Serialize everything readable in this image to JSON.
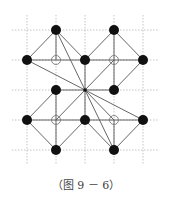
{
  "caption": "（图 9 － 6）",
  "grid": {
    "xs": [
      27,
      56,
      85,
      114,
      143
    ],
    "ys": [
      30,
      60,
      90,
      120,
      150
    ],
    "extent": {
      "x0": 12,
      "x1": 158,
      "y0": 15,
      "y1": 165
    },
    "color": "#b5b5b5"
  },
  "colors": {
    "line": "#555555",
    "dot": "#111111",
    "hollow_stroke": "#777777"
  },
  "filled_points": [
    [
      1,
      0
    ],
    [
      3,
      0
    ],
    [
      0,
      1
    ],
    [
      2,
      1
    ],
    [
      4,
      1
    ],
    [
      1,
      2
    ],
    [
      3,
      2
    ],
    [
      0,
      3
    ],
    [
      2,
      3
    ],
    [
      4,
      3
    ],
    [
      1,
      4
    ],
    [
      3,
      4
    ]
  ],
  "hollow_points": [
    [
      1,
      1
    ],
    [
      3,
      1
    ],
    [
      1,
      3
    ],
    [
      3,
      3
    ]
  ],
  "center_point": [
    2,
    2
  ],
  "segments": [
    [
      [
        1,
        0
      ],
      [
        0,
        1
      ]
    ],
    [
      [
        1,
        0
      ],
      [
        1,
        1
      ]
    ],
    [
      [
        1,
        0
      ],
      [
        2,
        1
      ]
    ],
    [
      [
        0,
        1
      ],
      [
        1,
        1
      ]
    ],
    [
      [
        1,
        1
      ],
      [
        2,
        1
      ]
    ],
    [
      [
        1,
        0
      ],
      [
        2,
        2
      ]
    ],
    [
      [
        0,
        1
      ],
      [
        2,
        2
      ]
    ],
    [
      [
        3,
        0
      ],
      [
        2,
        1
      ]
    ],
    [
      [
        3,
        0
      ],
      [
        3,
        1
      ]
    ],
    [
      [
        3,
        0
      ],
      [
        4,
        1
      ]
    ],
    [
      [
        2,
        1
      ],
      [
        3,
        1
      ]
    ],
    [
      [
        3,
        1
      ],
      [
        4,
        1
      ]
    ],
    [
      [
        2,
        1
      ],
      [
        2,
        2
      ]
    ],
    [
      [
        3,
        1
      ],
      [
        2,
        2
      ]
    ],
    [
      [
        4,
        1
      ],
      [
        3,
        2
      ]
    ],
    [
      [
        3,
        1
      ],
      [
        3,
        2
      ]
    ],
    [
      [
        0,
        3
      ],
      [
        1,
        2
      ]
    ],
    [
      [
        1,
        2
      ],
      [
        1,
        3
      ]
    ],
    [
      [
        1,
        2
      ],
      [
        2,
        2
      ]
    ],
    [
      [
        1,
        3
      ],
      [
        2,
        2
      ]
    ],
    [
      [
        0,
        3
      ],
      [
        1,
        3
      ]
    ],
    [
      [
        1,
        3
      ],
      [
        2,
        3
      ]
    ],
    [
      [
        0,
        3
      ],
      [
        1,
        4
      ]
    ],
    [
      [
        1,
        3
      ],
      [
        1,
        4
      ]
    ],
    [
      [
        2,
        3
      ],
      [
        1,
        4
      ]
    ],
    [
      [
        3,
        2
      ],
      [
        2,
        2
      ]
    ],
    [
      [
        2,
        2
      ],
      [
        2,
        3
      ]
    ],
    [
      [
        2,
        2
      ],
      [
        3,
        3
      ]
    ],
    [
      [
        2,
        2
      ],
      [
        4,
        3
      ]
    ],
    [
      [
        2,
        2
      ],
      [
        3,
        4
      ]
    ],
    [
      [
        2,
        3
      ],
      [
        3,
        3
      ]
    ],
    [
      [
        3,
        3
      ],
      [
        4,
        3
      ]
    ],
    [
      [
        3,
        3
      ],
      [
        3,
        4
      ]
    ],
    [
      [
        2,
        3
      ],
      [
        3,
        4
      ]
    ],
    [
      [
        4,
        3
      ],
      [
        3,
        4
      ]
    ]
  ]
}
